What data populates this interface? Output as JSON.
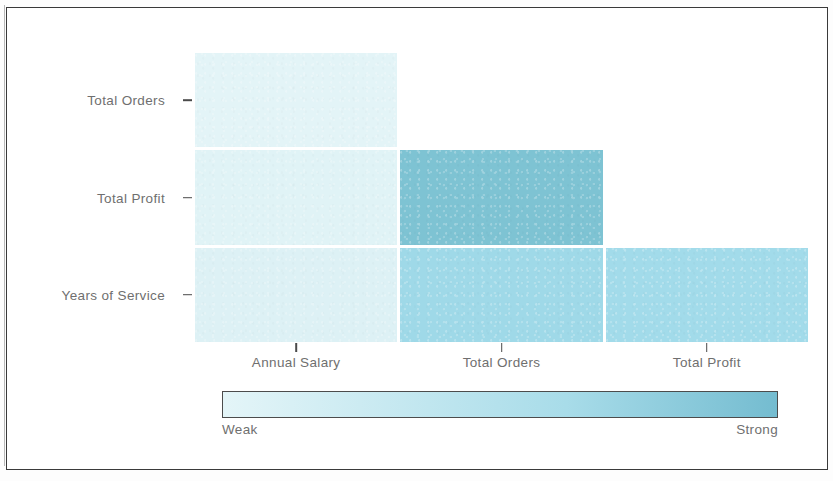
{
  "chart_data": {
    "type": "heatmap",
    "title": "",
    "subtitle": "",
    "xlabel": "",
    "ylabel": "",
    "grid": false,
    "legend_position": "bottom",
    "triangular": "lower",
    "x_categories": [
      "Annual Salary",
      "Total Orders",
      "Total Profit"
    ],
    "y_categories": [
      "Total Orders",
      "Total Profit",
      "Years of Service"
    ],
    "colorbar": {
      "low_label": "Weak",
      "high_label": "Strong",
      "low_color": "#e4f5f8",
      "mid_color": "#a8dce9",
      "high_color": "#74bcd0",
      "orientation": "horizontal"
    },
    "cells": [
      {
        "row": "Total Orders",
        "col": "Annual Salary",
        "strength": 0.08,
        "color": "#e3f4f7"
      },
      {
        "row": "Total Profit",
        "col": "Annual Salary",
        "strength": 0.1,
        "color": "#e0f3f6"
      },
      {
        "row": "Total Profit",
        "col": "Total Orders",
        "strength": 0.95,
        "color": "#7ec3d3"
      },
      {
        "row": "Years of Service",
        "col": "Annual Salary",
        "strength": 0.12,
        "color": "#ddf1f5"
      },
      {
        "row": "Years of Service",
        "col": "Total Orders",
        "strength": 0.62,
        "color": "#9fd9e8"
      },
      {
        "row": "Years of Service",
        "col": "Total Profit",
        "strength": 0.6,
        "color": "#a2dbea"
      }
    ]
  },
  "axes": {
    "y_ticks": [
      {
        "label": "Total Orders"
      },
      {
        "label": "Total Profit"
      },
      {
        "label": "Years of Service"
      }
    ],
    "x_ticks": [
      {
        "label": "Annual Salary"
      },
      {
        "label": "Total Orders"
      },
      {
        "label": "Total Profit"
      }
    ]
  },
  "legend": {
    "low_label": "Weak",
    "high_label": "Strong"
  },
  "colors": {
    "axis_text": "#6f6f6f",
    "tick_mark": "#4a4a4a",
    "frame": "#3a3a3a",
    "background": "#ffffff"
  }
}
